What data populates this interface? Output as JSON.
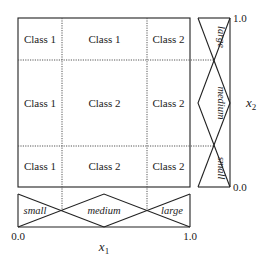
{
  "diagram": {
    "type": "fuzzy-rule-grid",
    "grid": {
      "rows": [
        {
          "x2_term": "large",
          "cells": [
            "Class 1",
            "Class 1",
            "Class 2"
          ]
        },
        {
          "x2_term": "medium",
          "cells": [
            "Class 1",
            "Class 2",
            "Class 2"
          ]
        },
        {
          "x2_term": "small",
          "cells": [
            "Class 1",
            "Class 2",
            "Class 2"
          ]
        }
      ],
      "columns_x1_terms": [
        "small",
        "medium",
        "large"
      ]
    },
    "x1_membership": {
      "terms": [
        "small",
        "medium",
        "large"
      ],
      "min_tick": "0.0",
      "max_tick": "1.0",
      "axis_label": "x",
      "axis_subscript": "1"
    },
    "x2_membership": {
      "terms": [
        "small",
        "medium",
        "large"
      ],
      "min_tick": "0.0",
      "max_tick": "1.0",
      "axis_label": "x",
      "axis_subscript": "2"
    },
    "colors": {
      "line": "#222222",
      "dotted": "#555555",
      "background": "#ffffff"
    }
  }
}
